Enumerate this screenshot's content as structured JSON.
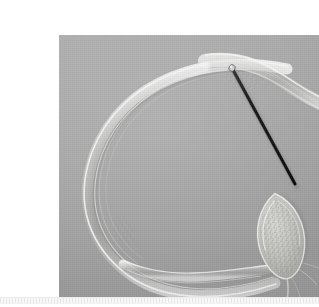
{
  "page": {
    "background_color": "#ffffff",
    "width": 319,
    "height": 307,
    "caption": "",
    "title": ""
  },
  "figure": {
    "name": "specimen-macro-photograph",
    "alt_text": "Macro photograph of a translucent filamentous specimen loop with a dark dissecting needle touching a speckled oval capsule",
    "frame": {
      "x": 19,
      "y": 19,
      "width": 281,
      "height": 269
    },
    "background_color": "#a8a8a8",
    "background_color_light": "#b2b2b2",
    "background_color_dark": "#9b9b9b",
    "grain": "visible",
    "scale_bar": "none",
    "label_text": ""
  },
  "subjects": [
    {
      "id": "filament-loop",
      "label": "translucent filament loop",
      "color": "#e8e8e6",
      "description": "large pale translucent ribbon forming an open loop across the left of the frame"
    },
    {
      "id": "ribbon-tail-right",
      "label": "ribbon tail extending to right edge",
      "color": "#e2e2df",
      "description": "flattened translucent band running off the upper right edge of the frame"
    },
    {
      "id": "ribbon-tail-bottom",
      "label": "ribbon tail along bottom",
      "color": "#dedede",
      "description": "lower translucent strand sweeping right toward the capsule base"
    },
    {
      "id": "oval-capsule",
      "label": "speckled oval capsule",
      "color": "#c8c8c4",
      "speckle_color": "#8f8f8c",
      "description": "granular pointed-oval body at lower right held at the needle tip"
    },
    {
      "id": "dissecting-needle",
      "label": "dissecting needle",
      "color": "#151515",
      "highlight_color": "#d8d8d8",
      "tip_point": "172,52",
      "contact_point": "236,168",
      "description": "dark slender probe angled from upper left down to the capsule"
    }
  ],
  "footer": {
    "rule_label": "ruled separator strip",
    "color": "#f4f4f4",
    "tick_color": "#e6e6e6"
  }
}
